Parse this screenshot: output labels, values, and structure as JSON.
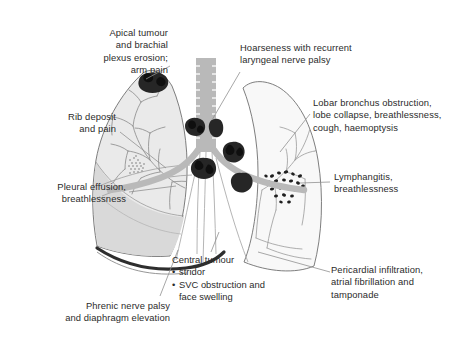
{
  "figure": {
    "background_color": "#ffffff",
    "palette": {
      "text": "#2b2b2b",
      "leader_line": "#8c8c8c",
      "lung_fill_left": "#e9e9e9",
      "lung_fill_right": "#f7f7f7",
      "outline": "#6e6e6e",
      "airway": "#b4b4b4",
      "tumour": "#2a2a2a",
      "effusion": "#d8d8d8",
      "diaphragm": "#303030"
    }
  },
  "labels": [
    {
      "id": "apical-tumour",
      "text": "Apical tumour\nand brachial\nplexus erosion;\narm pain",
      "align": "right"
    },
    {
      "id": "hoarseness",
      "text": "Hoarseness with recurrent\nlaryngeal nerve palsy",
      "align": "left"
    },
    {
      "id": "rib-deposit",
      "text": "Rib deposit\nand pain",
      "align": "right"
    },
    {
      "id": "lobar-bronchus",
      "text": "Lobar bronchus obstruction,\nlobe collapse, breathlessness,\ncough, haemoptysis",
      "align": "left"
    },
    {
      "id": "pleural-effusion",
      "text": "Pleural effusion,\nbreathlessness",
      "align": "right"
    },
    {
      "id": "lymphangitis",
      "text": "Lymphangitis,\nbreathlessness",
      "align": "left"
    },
    {
      "id": "pericardial",
      "text": "Pericardial infiltration,\natrial fibrillation and\ntamponade",
      "align": "left"
    },
    {
      "id": "phrenic-nerve",
      "text": "Phrenic nerve palsy\nand diaphragm elevation",
      "align": "right"
    }
  ],
  "central_tumour": {
    "heading": "Central tumour",
    "items": [
      "stridor",
      "SVC obstruction and\nface swelling"
    ]
  },
  "anatomy": {
    "parts": [
      "left-lung",
      "right-lung",
      "trachea",
      "left-main-bronchus",
      "right-main-bronchus",
      "bronchial-tree-left",
      "bronchial-tree-right",
      "diaphragm-line"
    ],
    "lesions": [
      "apical-tumour-mass",
      "paratracheal-node-left",
      "paratracheal-node-right",
      "carinal-tumour-mass",
      "right-hilar-tumour-mass",
      "lymphangitis-speckles",
      "rib-deposit-stipple",
      "pleural-effusion-area"
    ]
  }
}
